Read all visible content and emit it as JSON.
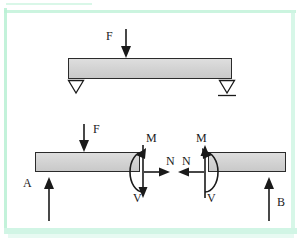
{
  "figure": {
    "type": "engineering-statics-diagram",
    "background_color": "#ffffff",
    "border_color": "#b9f0d4",
    "beam_fill_color": "#d4d4d4",
    "beam_stroke_color": "#2b2b2b",
    "annotation_color": "#1a1a1a"
  },
  "top_diagram": {
    "name": "simply-supported-beam",
    "load_label": "F",
    "left_support_type": "triangle-pin-support",
    "right_support_type": "triangle-roller-support",
    "beam": {
      "x": 68,
      "y": 58,
      "width": 164,
      "height": 21
    }
  },
  "bottom_diagram": {
    "name": "free-body-diagram-cut-section",
    "load_label": "F",
    "reaction_left_label": "A",
    "reaction_right_label": "B",
    "left_segment": {
      "beam": {
        "x": 35,
        "y": 152,
        "width": 105,
        "height": 20
      },
      "moment_label": "M",
      "normal_label": "N",
      "shear_label": "V"
    },
    "right_segment": {
      "beam": {
        "x": 208,
        "y": 152,
        "width": 78,
        "height": 20
      },
      "moment_label": "M",
      "normal_label": "N",
      "shear_label": "V"
    }
  },
  "labels": {
    "F_top": "F",
    "F_bottom": "F",
    "A": "A",
    "B": "B",
    "M_left": "M",
    "M_right": "M",
    "N_left": "N",
    "N_right": "N",
    "V_left": "V",
    "V_right": "V"
  }
}
